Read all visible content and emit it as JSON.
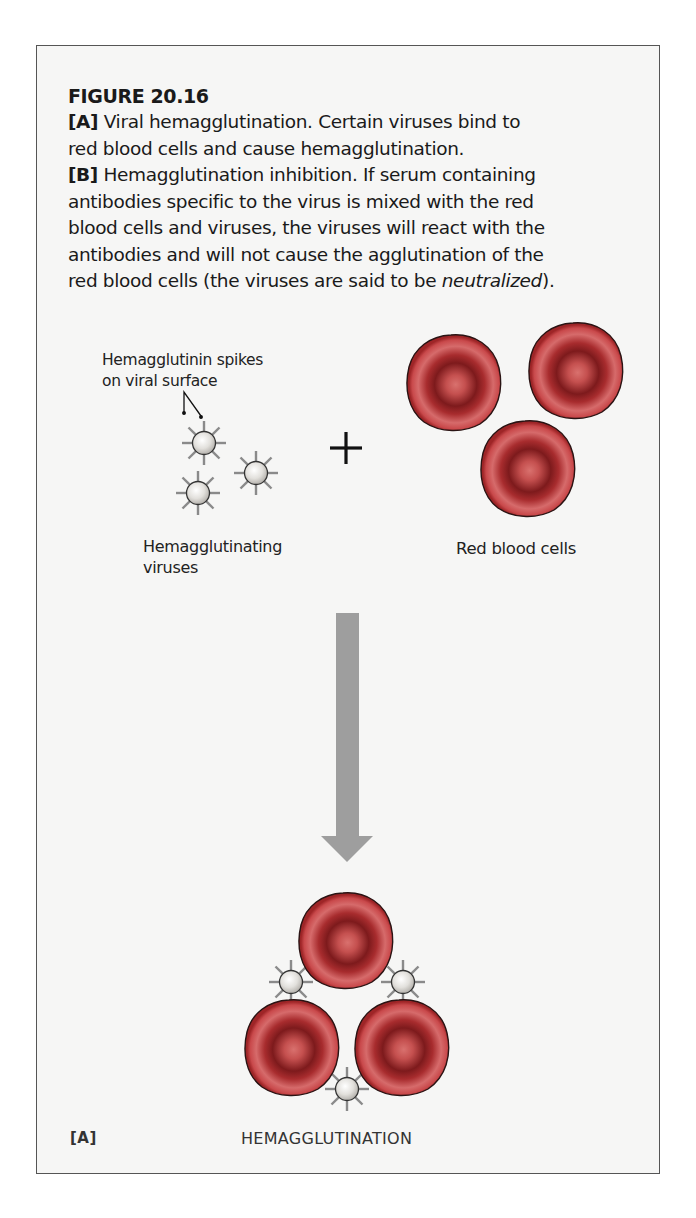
{
  "figure": {
    "title": "FIGURE 20.16",
    "caption": {
      "part_a_tag": "[A]",
      "part_a_text_line1": " Viral hemagglutination. Certain viruses bind to",
      "part_a_text_line2": "red blood cells and cause hemagglutination.",
      "part_b_tag": "[B]",
      "part_b_text_line1": " Hemagglutination inhibition. If serum containing",
      "part_b_text_line2": "antibodies specific to the virus is mixed with the red",
      "part_b_text_line3": "blood cells and viruses, the viruses will react with the",
      "part_b_text_line4": "antibodies and will not cause the agglutination of the",
      "part_b_text_line5_pre": "red blood cells (the viruses are said to be ",
      "part_b_text_line5_italic": "neutralized",
      "part_b_text_line5_post": ")."
    }
  },
  "diagram": {
    "panel_label": "[A]",
    "spikes_label_line1": "Hemagglutinin spikes",
    "spikes_label_line2": "on viral surface",
    "viruses_label_line1": "Hemagglutinating",
    "viruses_label_line2": "viruses",
    "plus_sign": "+",
    "rbc_label": "Red blood cells",
    "result_label": "HEMAGGLUTINATION",
    "colors": {
      "frame_border": "#555555",
      "frame_bg": "#f6f6f5",
      "rbc_outer": "#c0393b",
      "rbc_rim": "#d9686a",
      "rbc_dark": "#7a1518",
      "rbc_center": "#d36a68",
      "virus_fill": "#e9e7e3",
      "spike": "#8a8a8a",
      "arrow": "#9e9e9e"
    }
  }
}
